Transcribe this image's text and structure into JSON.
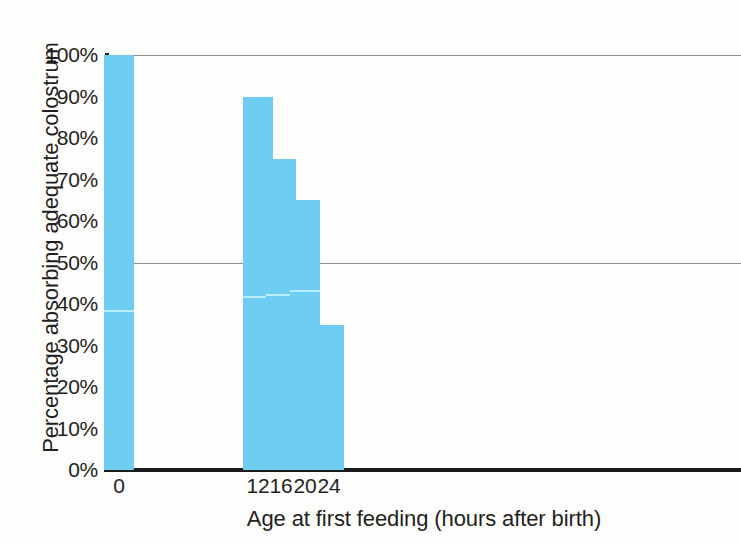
{
  "chart_data": {
    "type": "bar",
    "title": "",
    "xlabel": "Age at first feeding (hours after birth)",
    "ylabel": "Percentage absorbing adequate colostrum",
    "categories": [
      "0",
      "12",
      "16",
      "20",
      "24"
    ],
    "values": [
      100,
      90,
      75,
      65,
      35
    ],
    "value_labels": [
      "100%",
      "90%",
      "75%",
      "65%",
      "35%"
    ],
    "series": [
      {
        "name": "Percentage absorbing adequate colostrum",
        "values": [
          100,
          90,
          75,
          65,
          35
        ]
      }
    ],
    "segment_divider_values": [
      38,
      41.5,
      42,
      43,
      null
    ],
    "ylim": [
      0,
      100
    ],
    "ytick_labels": [
      "0%",
      "10%",
      "20%",
      "30%",
      "40%",
      "50%",
      "60%",
      "70%",
      "80%",
      "90%",
      "100%"
    ],
    "ytick_values": [
      0,
      10,
      20,
      30,
      40,
      50,
      60,
      70,
      80,
      90,
      100
    ],
    "xtick_labels": [
      "0",
      "12",
      "16",
      "20",
      "24"
    ],
    "xtick_positions": [
      12,
      151,
      174,
      198,
      222
    ],
    "gridlines": [
      50,
      100
    ],
    "grid": true,
    "legend": "none",
    "bar_color": "#6ecdf0",
    "grid_color": "#8c8c8c",
    "axis_color": "#1a1a1a",
    "background_color": "#fdfdfc"
  }
}
